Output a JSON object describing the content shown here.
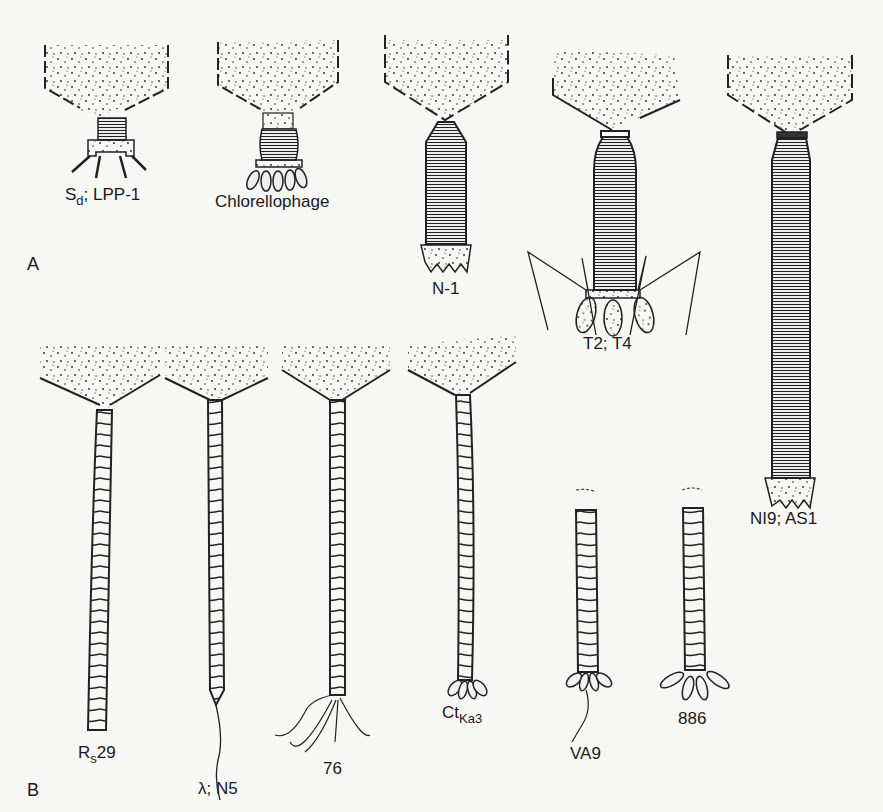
{
  "figure": {
    "panels": [
      {
        "id": "A",
        "label": "A"
      },
      {
        "id": "B",
        "label": "B"
      }
    ],
    "phages": [
      {
        "id": "sd-lpp1",
        "panel": "A",
        "label_main": "S",
        "label_sub": "d",
        "label_rest": "; LPP-1",
        "tail": "short-striated",
        "baseplate": "spiked"
      },
      {
        "id": "chlorellophage",
        "panel": "A",
        "label_main": "Chlorellophage",
        "tail": "short-contractile",
        "baseplate": "fibers"
      },
      {
        "id": "n1",
        "panel": "A",
        "label_main": "N-1",
        "tail": "contractile",
        "baseplate": "toothed"
      },
      {
        "id": "t2-t4",
        "panel": "A",
        "label_main": "T2; T4",
        "tail": "contractile",
        "baseplate": "long-fibers"
      },
      {
        "id": "ni9-as1",
        "panel": "A",
        "label_main": "NI9; AS1",
        "tail": "long-contractile",
        "baseplate": "toothed"
      },
      {
        "id": "rs29",
        "panel": "B",
        "label_main": "R",
        "label_sub": "s",
        "label_rest": "29",
        "tail": "flexible",
        "baseplate": "none"
      },
      {
        "id": "lambda-n5",
        "panel": "B",
        "label_main": "λ; N5",
        "tail": "flexible",
        "baseplate": "single-fiber"
      },
      {
        "id": "p76",
        "panel": "B",
        "label_main": "76",
        "tail": "flexible",
        "baseplate": "multi-fiber"
      },
      {
        "id": "ct-ka3",
        "panel": "B",
        "label_main": "Ct",
        "label_sub": "Ka3",
        "tail": "flexible",
        "baseplate": "knobs"
      },
      {
        "id": "va9",
        "panel": "B",
        "label_main": "VA9",
        "tail": "flexible",
        "baseplate": "knobs-fiber"
      },
      {
        "id": "p886",
        "panel": "B",
        "label_main": "886",
        "tail": "flexible",
        "baseplate": "knobs-long"
      }
    ],
    "colors": {
      "ink": "#1a1a1a",
      "paper": "#f7f7f5"
    }
  }
}
